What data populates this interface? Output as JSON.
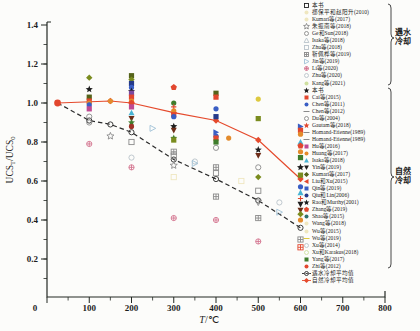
{
  "figure": {
    "background": "#fcfcfa",
    "axis_color": "#232823"
  },
  "chart_data": {
    "type": "scatter",
    "title": "",
    "xlabel": "T/℃",
    "xlabel_T": "T",
    "xlabel_rest": "/℃",
    "ylabel": "UCS_T/UCS_0",
    "ylabel_display": {
      "p0": "UCS",
      "s0": "T",
      "p1": "/UCS",
      "s1": "0"
    },
    "xlim": [
      0,
      800
    ],
    "ylim": [
      0,
      1.45
    ],
    "x_major_ticks": [
      0,
      100,
      200,
      300,
      400,
      500,
      600,
      700,
      800
    ],
    "x_minor_step": 50,
    "y_major_ticks": [
      "0.2",
      "0.4",
      "0.6",
      "0.8",
      "1.0",
      "1.2",
      "1.4"
    ],
    "y_minor_step": 0.1,
    "grid": false,
    "legend_position": "right-outside",
    "colors": {
      "red": "#e2472e",
      "darkred": "#a03228",
      "orange": "#e38b2c",
      "yellow": "#ddc93f",
      "lightyellow": "#efe7c0",
      "olive": "#7a8c1e",
      "darkolive": "#55631a",
      "green": "#3f7d2c",
      "lightgreen": "#cfe0a0",
      "cyan": "#49b4d4",
      "blue": "#3a5ec4",
      "navy": "#253a8a",
      "purple": "#7c4ba0",
      "magenta": "#bf4a92",
      "brown": "#6e2d18",
      "black": "#1f1f1f",
      "pink": "#d4748e",
      "gray": "#8a8a8a",
      "lightgray": "#b9c3ca",
      "lightblue": "#9fc1d6",
      "teal": "#2f6f6f",
      "line_red": "#e54a2c",
      "line_black": "#2a2a2a"
    },
    "series": [
      {
        "name": "遇水冷却平均值",
        "type": "line",
        "style": "dashed",
        "color_key": "line_black",
        "marker": "circle-open",
        "points": [
          [
            25,
            1.0
          ],
          [
            100,
            0.91
          ],
          [
            150,
            0.89
          ],
          [
            200,
            0.85
          ],
          [
            300,
            0.71
          ],
          [
            400,
            0.61
          ],
          [
            500,
            0.5
          ],
          [
            600,
            0.36
          ]
        ]
      },
      {
        "name": "自然冷却平均值",
        "type": "line",
        "style": "solid",
        "color_key": "line_red",
        "marker": "diamond",
        "points": [
          [
            25,
            1.0
          ],
          [
            150,
            1.01
          ],
          [
            200,
            1.0
          ],
          [
            300,
            0.95
          ],
          [
            400,
            0.91
          ],
          [
            500,
            0.81
          ],
          [
            600,
            0.61
          ]
        ]
      }
    ],
    "scatter_points": [
      [
        25,
        1.0,
        "red",
        "circle"
      ],
      [
        100,
        1.13,
        "olive",
        "diamond"
      ],
      [
        100,
        1.07,
        "black",
        "star"
      ],
      [
        100,
        1.03,
        "darkolive",
        "square"
      ],
      [
        100,
        1.01,
        "red",
        "square"
      ],
      [
        100,
        1.0,
        "orange",
        "circle"
      ],
      [
        100,
        0.99,
        "blue",
        "circle"
      ],
      [
        100,
        0.97,
        "magenta",
        "square"
      ],
      [
        100,
        0.93,
        "gray",
        "circle-open"
      ],
      [
        100,
        0.9,
        "gray",
        "circle-open"
      ],
      [
        100,
        0.79,
        "pink",
        "circle-plus"
      ],
      [
        150,
        1.01,
        "orange",
        "circle"
      ],
      [
        150,
        0.83,
        "gray",
        "star-open"
      ],
      [
        200,
        1.14,
        "darkolive",
        "square"
      ],
      [
        200,
        1.12,
        "olive",
        "diamond"
      ],
      [
        200,
        1.1,
        "navy",
        "square"
      ],
      [
        200,
        1.08,
        "blue",
        "circle"
      ],
      [
        200,
        1.06,
        "black",
        "star"
      ],
      [
        200,
        1.05,
        "purple",
        "square"
      ],
      [
        200,
        1.03,
        "red",
        "square"
      ],
      [
        200,
        1.01,
        "orange",
        "circle"
      ],
      [
        200,
        1.0,
        "red",
        "pentagon"
      ],
      [
        200,
        0.98,
        "magenta",
        "square"
      ],
      [
        200,
        0.95,
        "cyan",
        "triangle-up"
      ],
      [
        200,
        0.92,
        "brown",
        "triangle-down"
      ],
      [
        200,
        0.9,
        "green",
        "star"
      ],
      [
        200,
        0.88,
        "darkred",
        "circle"
      ],
      [
        200,
        0.8,
        "gray",
        "square-open"
      ],
      [
        200,
        0.72,
        "lightgray",
        "circle-open"
      ],
      [
        200,
        0.67,
        "pink",
        "circle-plus"
      ],
      [
        250,
        0.87,
        "lightblue",
        "triangle-right-open"
      ],
      [
        300,
        1.08,
        "red",
        "pentagon"
      ],
      [
        300,
        1.0,
        "green",
        "circle"
      ],
      [
        300,
        0.98,
        "red",
        "cross"
      ],
      [
        300,
        0.96,
        "orange",
        "circle"
      ],
      [
        300,
        0.94,
        "red",
        "square"
      ],
      [
        300,
        0.93,
        "blue",
        "circle"
      ],
      [
        300,
        0.88,
        "black",
        "star"
      ],
      [
        300,
        0.86,
        "brown",
        "triangle-down"
      ],
      [
        300,
        0.82,
        "green",
        "star"
      ],
      [
        300,
        0.81,
        "olive",
        "square"
      ],
      [
        300,
        0.75,
        "gray",
        "square-cross"
      ],
      [
        300,
        0.73,
        "gray",
        "square-open"
      ],
      [
        300,
        0.68,
        "gray",
        "star-open"
      ],
      [
        300,
        0.62,
        "lightyellow",
        "square-open"
      ],
      [
        300,
        0.41,
        "pink",
        "circle-plus"
      ],
      [
        350,
        0.7,
        "lightgray",
        "circle-open"
      ],
      [
        350,
        0.69,
        "lightblue",
        "triangle-right-open"
      ],
      [
        400,
        1.05,
        "darkolive",
        "square"
      ],
      [
        400,
        1.03,
        "red",
        "square"
      ],
      [
        400,
        0.97,
        "blue",
        "circle"
      ],
      [
        400,
        0.93,
        "navy",
        "square"
      ],
      [
        400,
        0.85,
        "blue",
        "triangle-right"
      ],
      [
        400,
        0.83,
        "blue",
        "circle"
      ],
      [
        400,
        0.82,
        "red",
        "square"
      ],
      [
        400,
        0.8,
        "green",
        "square"
      ],
      [
        400,
        0.77,
        "gray",
        "circle-open"
      ],
      [
        400,
        0.67,
        "gray",
        "square-cross"
      ],
      [
        400,
        0.64,
        "gray",
        "square-open"
      ],
      [
        400,
        0.52,
        "gray",
        "square-cross"
      ],
      [
        400,
        0.4,
        "pink",
        "circle-plus"
      ],
      [
        430,
        0.82,
        "orange",
        "circle"
      ],
      [
        460,
        0.6,
        "lightyellow",
        "square-open"
      ],
      [
        500,
        1.02,
        "yellow",
        "circle"
      ],
      [
        500,
        0.92,
        "olive",
        "square"
      ],
      [
        500,
        0.76,
        "black",
        "star"
      ],
      [
        500,
        0.73,
        "brown",
        "triangle-down"
      ],
      [
        500,
        0.67,
        "gray",
        "circle-open"
      ],
      [
        500,
        0.62,
        "olive",
        "diamond"
      ],
      [
        500,
        0.55,
        "gray",
        "square-open"
      ],
      [
        500,
        0.49,
        "gray",
        "triangle-down-open"
      ],
      [
        500,
        0.41,
        "gray",
        "square-cross"
      ],
      [
        500,
        0.29,
        "pink",
        "circle-plus"
      ],
      [
        550,
        0.49,
        "lightgray",
        "circle-open"
      ],
      [
        550,
        0.44,
        "lightblue",
        "triangle-right-open"
      ],
      [
        600,
        0.88,
        "blue",
        "triangle-right"
      ],
      [
        600,
        0.86,
        "red",
        "square"
      ],
      [
        600,
        0.84,
        "orange",
        "circle"
      ],
      [
        600,
        0.8,
        "cyan",
        "triangle-up"
      ],
      [
        600,
        0.78,
        "red",
        "pentagon"
      ],
      [
        600,
        0.75,
        "orange",
        "circle"
      ],
      [
        600,
        0.72,
        "green",
        "square"
      ],
      [
        600,
        0.67,
        "black",
        "star"
      ],
      [
        600,
        0.63,
        "olive",
        "square"
      ],
      [
        600,
        0.57,
        "blue",
        "circle"
      ],
      [
        600,
        0.54,
        "cyan",
        "triangle-up"
      ],
      [
        600,
        0.51,
        "red",
        "cross"
      ],
      [
        600,
        0.48,
        "black",
        "triangle-down"
      ],
      [
        600,
        0.45,
        "brown",
        "triangle-down"
      ],
      [
        600,
        0.43,
        "olive",
        "diamond"
      ],
      [
        600,
        0.4,
        "orange",
        "circle"
      ],
      [
        600,
        0.3,
        "gray",
        "square-cross"
      ],
      [
        600,
        0.26,
        "red",
        "square-cross"
      ]
    ]
  },
  "legend": {
    "water_group": {
      "line1": "遇水",
      "line2": "冷却"
    },
    "natural_group": {
      "line1": "自然",
      "line2": "冷却"
    },
    "water": [
      {
        "marker": "square-open",
        "color_key": "black",
        "label": "本书"
      },
      {
        "marker": "circle",
        "color_key": "lightyellow",
        "label": "郤保平和赵阳升(2010)"
      },
      {
        "marker": "circle",
        "color_key": "lightyellow",
        "label": "Kumari等(2017)"
      },
      {
        "marker": "star-open",
        "color_key": "gray",
        "label": "朱振南等(2018)"
      },
      {
        "marker": "circle-open",
        "color_key": "gray",
        "label": "Ge和Sun(2018)"
      },
      {
        "marker": "triangle-up-open",
        "color_key": "lightgray",
        "label": "Isaka等(2018)"
      },
      {
        "marker": "square-open",
        "color_key": "lightgray",
        "label": "Zhu等(2018)"
      },
      {
        "marker": "square-cross",
        "color_key": "gray",
        "label": "靳佩桦等(2019)"
      },
      {
        "marker": "triangle-right-open",
        "color_key": "lightblue",
        "label": "Jin等(2019)"
      },
      {
        "marker": "circle-plus",
        "color_key": "pink",
        "label": "Li等(2020)"
      },
      {
        "marker": "circle-open",
        "color_key": "lightgray",
        "label": "Zhu等(2020)"
      },
      {
        "marker": "circle",
        "color_key": "lightgreen",
        "label": "Kang等(2021)"
      }
    ],
    "natural": [
      {
        "marker": "star",
        "color_key": "black",
        "label": "本书"
      },
      {
        "marker": "square",
        "color_key": "red",
        "label": "Cai等(2015)"
      },
      {
        "marker": "circle",
        "color_key": "blue",
        "label": "Chen等(2011)"
      },
      {
        "marker": "dash",
        "color_key": "gray",
        "label": "Chen等(2012)"
      },
      {
        "marker": "circle-open",
        "color_key": "gray",
        "label": "Du等(2004)"
      },
      {
        "marker": "star",
        "color_key": "red",
        "label": "Gautam等(2018)"
      },
      {
        "marker": "dash",
        "color_key": "gray",
        "label": "Homand-Etienne(1989)"
      },
      {
        "marker": "dash",
        "color_key": "gray",
        "label": "Homand-Etienne(1989)"
      },
      {
        "marker": "square",
        "color_key": "magenta",
        "label": "Hu等(2016)"
      },
      {
        "marker": "circle",
        "color_key": "orange",
        "label": "Huang等(2017)"
      },
      {
        "marker": "triangle-up",
        "color_key": "cyan",
        "label": "Isaka等(2018)"
      },
      {
        "marker": "triangle-down",
        "color_key": "black",
        "label": "Yin等(2019)"
      },
      {
        "marker": "diamond",
        "color_key": "darkolive",
        "label": "Kumari等(2017)"
      },
      {
        "marker": "triangle-left",
        "color_key": "red",
        "label": "Liu和Xu(2015)"
      },
      {
        "marker": "square",
        "color_key": "blue",
        "label": "Qin等(2019)"
      },
      {
        "marker": "circle",
        "color_key": "navy",
        "label": "Qiu和Lin(2006)"
      },
      {
        "marker": "star",
        "color_key": "black",
        "label": "Rao和Murthy(2001)"
      },
      {
        "marker": "pentagon",
        "color_key": "red",
        "label": "Zhang等(2019)"
      },
      {
        "marker": "circle",
        "color_key": "teal",
        "label": "Shao等(2015)"
      },
      {
        "marker": "circle",
        "color_key": "lightyellow",
        "label": "Wang等(2018)"
      },
      {
        "marker": "circle",
        "color_key": "lightyellow",
        "label": "Wu等(2015)"
      },
      {
        "marker": "dash",
        "color_key": "yellow",
        "label": "Wu等(2019)"
      },
      {
        "marker": "circle-open",
        "color_key": "lightgray",
        "label": "Xu等(2014)"
      },
      {
        "marker": "circle-open",
        "color_key": "lightgreen",
        "label": "Xu和Karakus(2018)"
      },
      {
        "marker": "square",
        "color_key": "green",
        "label": "Yang等(2017)"
      },
      {
        "marker": "circle",
        "color_key": "red",
        "label": "Zhi等(2012)"
      }
    ],
    "averages": [
      {
        "sample": "dashed-line",
        "marker": "circle-open",
        "color_key": "line_black",
        "label": "遇水冷却平均值"
      },
      {
        "sample": "solid-line",
        "marker": "diamond",
        "color_key": "line_red",
        "label": "自然冷却平均值"
      }
    ]
  }
}
